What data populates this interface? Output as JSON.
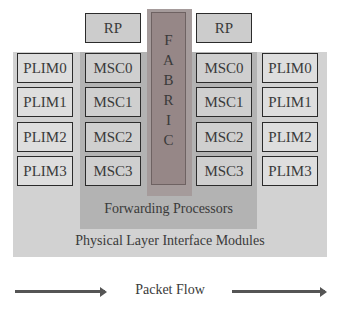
{
  "diagram": {
    "title": "",
    "route_processors": [
      {
        "label": "RP",
        "side": "left"
      },
      {
        "label": "RP",
        "side": "right"
      }
    ],
    "fabric": {
      "label": "FABRIC",
      "letters": [
        "F",
        "A",
        "B",
        "R",
        "I",
        "C"
      ]
    },
    "left": {
      "plims": [
        "PLIM0",
        "PLIM1",
        "PLIM2",
        "PLIM3"
      ],
      "mscs": [
        "MSC0",
        "MSC1",
        "MSC2",
        "MSC3"
      ]
    },
    "right": {
      "mscs": [
        "MSC0",
        "MSC1",
        "MSC2",
        "MSC3"
      ],
      "plims": [
        "PLIM0",
        "PLIM1",
        "PLIM2",
        "PLIM3"
      ]
    },
    "forwarding_label": "Forwarding Processors",
    "plim_region_label": "Physical Layer Interface Modules",
    "flow_label": "Packet Flow"
  },
  "colors": {
    "plim_panel": "#d2d2d2",
    "fp_panel": "#b3b3b3",
    "fabric": "#968787",
    "box_border": "#2b2b2b"
  }
}
